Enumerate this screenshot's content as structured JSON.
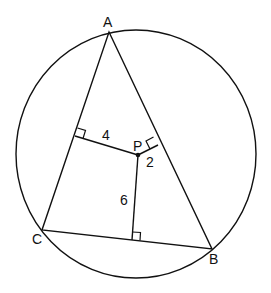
{
  "diagram": {
    "type": "geometry",
    "points": {
      "A": {
        "label": "A",
        "x": 109,
        "y": 32
      },
      "B": {
        "label": "B",
        "x": 212,
        "y": 249
      },
      "C": {
        "label": "C",
        "x": 42,
        "y": 230
      },
      "P": {
        "label": "P",
        "x": 138,
        "y": 155
      }
    },
    "perpendiculars": [
      {
        "to_side": "AC",
        "length_label": "4"
      },
      {
        "to_side": "AB",
        "length_label": "2"
      },
      {
        "to_side": "CB",
        "length_label": "6"
      }
    ],
    "circle": {
      "cx": 136,
      "cy": 154,
      "rx": 120,
      "ry": 124
    }
  }
}
